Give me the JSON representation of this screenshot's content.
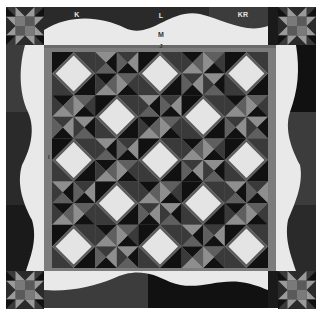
{
  "labels": {
    "k": "K",
    "l": "L",
    "kr": "KR",
    "m": "M",
    "j": "J",
    "i": "I"
  },
  "colors": {
    "background": "#ffffff",
    "outer_band_dark": "#1a1a1a",
    "outer_band_mid": "#3c3c3c",
    "wavy_border": "#e9e9e9",
    "inner_frame": "#7c7c7c",
    "diamond_fill": "#e4e4e4",
    "diamond_outline": "#5a5a5a",
    "triangle_black": "#111111",
    "triangle_dark": "#3a3a3a",
    "triangle_mid": "#5f5f5f",
    "triangle_light": "#8e8e8e"
  },
  "center_grid": {
    "rows": 5,
    "cols": 5,
    "diamond_blocks": 13,
    "triangle_blocks": 12
  },
  "corner_blocks": [
    "star-block-top-left",
    "star-block-top-right",
    "star-block-bottom-left",
    "star-block-bottom-right"
  ]
}
